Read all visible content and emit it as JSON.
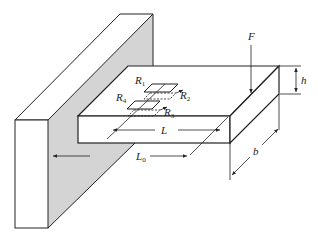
{
  "diagram": {
    "labels": {
      "force": "F",
      "height": "h",
      "width": "b",
      "length": "L",
      "length0": "L",
      "length0_sub": "0",
      "r1": "R",
      "r1_sub": "1",
      "r2": "R",
      "r2_sub": "2",
      "r3": "R",
      "r3_sub": "3",
      "r4": "R",
      "r4_sub": "4"
    },
    "colors": {
      "line": "#222222",
      "shade": "#d4d4d4",
      "background": "#ffffff"
    }
  }
}
